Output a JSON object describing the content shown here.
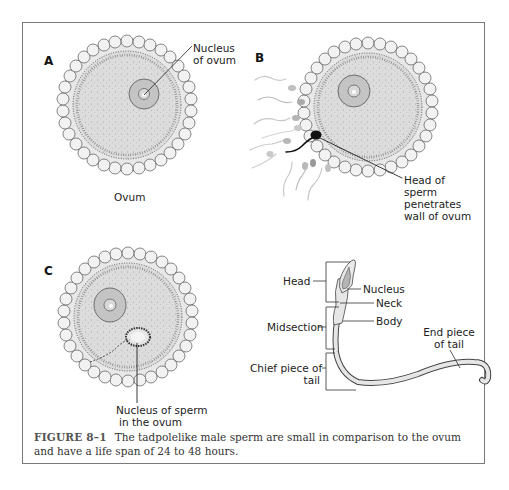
{
  "panels": {
    "a": {
      "letter": "A",
      "nucleus_label_line1": "Nucleus",
      "nucleus_label_line2": "of ovum",
      "ovum_label": "Ovum"
    },
    "b": {
      "letter": "B",
      "sperm_label_line1": "Head of",
      "sperm_label_line2": "sperm",
      "sperm_label_line3": "penetrates",
      "sperm_label_line4": "wall of ovum"
    },
    "c": {
      "letter": "C",
      "nucleus_sperm_label_line1": "Nucleus of sperm",
      "nucleus_sperm_label_line2": "in the ovum"
    },
    "sperm_anatomy": {
      "head": "Head",
      "nucleus": "Nucleus",
      "neck": "Neck",
      "midsection": "Midsection",
      "body": "Body",
      "chief_piece_line1": "Chief piece of",
      "chief_piece_line2": "tail",
      "end_piece_line1": "End piece",
      "end_piece_line2": "of tail"
    }
  },
  "caption": {
    "figure_number": "FIGURE 8–1",
    "text": "The tadpolelike male sperm are small in comparison to the ovum and have a life span of 24 to 48 hours."
  },
  "colors": {
    "frame": "#7a7a7a",
    "cytoplasm": "#dcdcdc",
    "nucleus": "#c4c4c4",
    "cell_outline": "#555555",
    "sperm_head_dark": "#111111",
    "sperm_faded": "#b5b5b5"
  }
}
